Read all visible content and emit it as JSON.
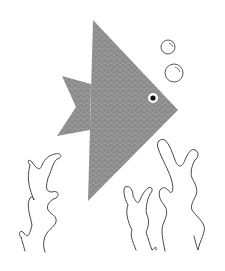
{
  "scene": {
    "description": "Origami paper fish with bubbles and seaweed",
    "colors": {
      "background": "#ffffff",
      "fish_body": "#8a8a8a",
      "fish_scale_pattern": "#a9a9a9",
      "outline": "#333333",
      "eye_ring": "#ffffff",
      "eye_pupil": "#111111"
    },
    "elements": [
      "fish-body",
      "fish-tail",
      "fish-eye",
      "bubble-small",
      "bubble-large",
      "seaweed-left",
      "seaweed-center",
      "seaweed-right"
    ]
  }
}
